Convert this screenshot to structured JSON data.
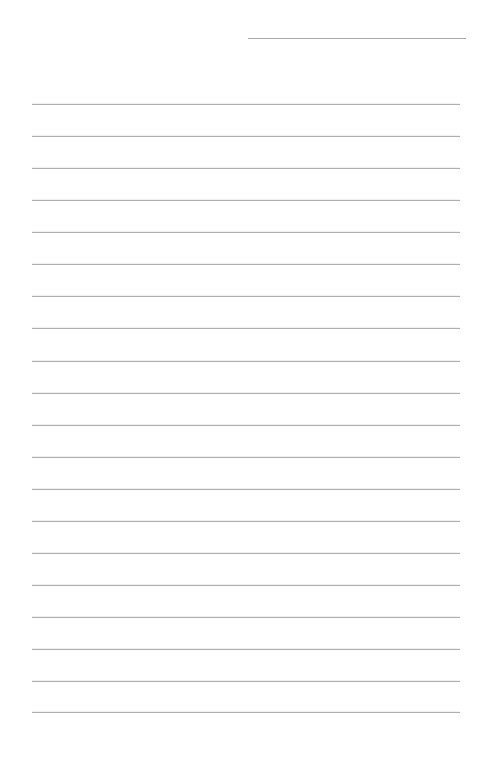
{
  "document": {
    "kind": "lined-note-page",
    "background_color": "#ffffff",
    "width": 480,
    "height": 757,
    "text_content": "",
    "has_visible_text": false
  },
  "header_rule": {
    "name": "title-rule",
    "x": 248,
    "y": 38,
    "width": 218,
    "color": "#a8a9ad",
    "thickness": 1
  },
  "ruling": {
    "color": "#adaeb2",
    "thickness": 1,
    "left_margin": 32,
    "right_margin": 20,
    "line_width": 428,
    "first_line_y": 104,
    "spacing": 32,
    "count": 20,
    "line_y_positions": [
      104,
      136,
      168,
      200,
      232,
      264,
      296,
      328,
      361,
      393,
      425,
      457,
      489,
      521,
      553,
      585,
      617,
      649,
      681,
      712
    ]
  }
}
